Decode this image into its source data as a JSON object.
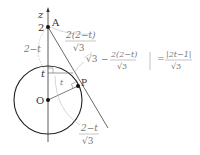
{
  "diagram": {
    "axis_label": "z",
    "point_A": "A",
    "point_P": "P",
    "point_O": "O",
    "tick_2": "2",
    "tick_t": "t",
    "angle_t": "t",
    "left_segment": "2−t",
    "frac_top_num": "2(2−t)",
    "frac_den": "√3",
    "eq_sqrt3": "√3",
    "eq_minus": "−",
    "eq_frac_num": "2(2−t)",
    "eq_frac_den": "√3",
    "eq_equals": "=",
    "eq_rhs_num": "|2t−1|",
    "eq_rhs_den": "√3",
    "frac_bottom_num": "2−t",
    "frac_bottom_den": "√3"
  },
  "colors": {
    "ink": "#222222",
    "label_gray": "#777777",
    "arc_gray": "#aaaaaa"
  }
}
